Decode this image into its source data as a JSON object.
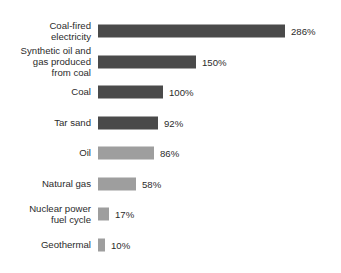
{
  "chart_data": {
    "type": "bar",
    "orientation": "horizontal",
    "title": "",
    "subtitle": "",
    "xlabel": "",
    "ylabel": "",
    "xlim": [
      0,
      286
    ],
    "grid": false,
    "legend": null,
    "value_suffix": "%",
    "categories": [
      "Coal-fired\nelectricity",
      "Synthetic oil and\ngas produced\nfrom coal",
      "Coal",
      "Tar sand",
      "Oil",
      "Natural gas",
      "Nuclear power\nfuel cycle",
      "Geothermal"
    ],
    "values": [
      286,
      150,
      100,
      92,
      86,
      58,
      17,
      10
    ],
    "value_labels": [
      "286%",
      "150%",
      "100%",
      "92%",
      "86%",
      "58%",
      "17%",
      "10%"
    ],
    "bar_colors": [
      "#4a4a4a",
      "#4a4a4a",
      "#4a4a4a",
      "#4a4a4a",
      "#9e9e9e",
      "#9e9e9e",
      "#9e9e9e",
      "#9e9e9e"
    ],
    "colors": {
      "background": "#ffffff",
      "dark_bar": "#4a4a4a",
      "light_bar": "#9e9e9e",
      "text": "#2b2b2b"
    }
  },
  "layout": {
    "plot_left_px": 98,
    "label_column_width_px": 91,
    "px_per_percent": 0.654,
    "bar_height_px": 13,
    "row_pitch_px": 30.5,
    "first_row_top_px": 16
  }
}
